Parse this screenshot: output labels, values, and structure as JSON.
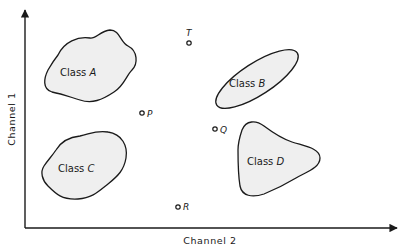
{
  "diagram": {
    "type": "feature-space scatter diagram",
    "axes": {
      "x_label": "Channel 2",
      "y_label": "Channel 1"
    },
    "classes": [
      {
        "id": "A",
        "label_prefix": "Class",
        "label_letter": "A"
      },
      {
        "id": "B",
        "label_prefix": "Class",
        "label_letter": "B"
      },
      {
        "id": "C",
        "label_prefix": "Class",
        "label_letter": "C"
      },
      {
        "id": "D",
        "label_prefix": "Class",
        "label_letter": "D"
      }
    ],
    "points": [
      {
        "id": "T",
        "label": "T"
      },
      {
        "id": "P",
        "label": "P"
      },
      {
        "id": "Q",
        "label": "Q"
      },
      {
        "id": "R",
        "label": "R"
      }
    ],
    "colors": {
      "stroke": "#1a1a1a",
      "fill": "#efefef",
      "background": "#ffffff"
    }
  }
}
